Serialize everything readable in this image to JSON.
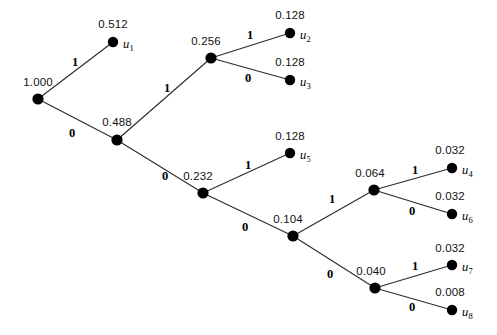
{
  "figure": {
    "background_color": "#ffffff",
    "node_color": "#000000",
    "edge_color": "#2b2b2b",
    "text_color": "#111111",
    "width": 497,
    "height": 335
  },
  "nodes": [
    {
      "id": "root",
      "label": "1.000",
      "x": 38,
      "y": 99,
      "label_x": 38,
      "label_y": 82,
      "leaf": false,
      "leaf_symbol": "",
      "sub": ""
    },
    {
      "id": "n1",
      "label": "0.512",
      "x": 113,
      "y": 42,
      "label_x": 113,
      "label_y": 24,
      "leaf": true,
      "leaf_symbol": "u",
      "sub": "1"
    },
    {
      "id": "n0",
      "label": "0.488",
      "x": 117,
      "y": 140,
      "label_x": 117,
      "label_y": 122,
      "leaf": false,
      "leaf_symbol": "",
      "sub": ""
    },
    {
      "id": "n01",
      "label": "0.256",
      "x": 211,
      "y": 58,
      "label_x": 206,
      "label_y": 41,
      "leaf": false,
      "leaf_symbol": "",
      "sub": ""
    },
    {
      "id": "n011",
      "label": "0.128",
      "x": 290,
      "y": 33,
      "label_x": 290,
      "label_y": 15,
      "leaf": true,
      "leaf_symbol": "u",
      "sub": "2"
    },
    {
      "id": "n010",
      "label": "0.128",
      "x": 290,
      "y": 80,
      "label_x": 290,
      "label_y": 62,
      "leaf": true,
      "leaf_symbol": "u",
      "sub": "3"
    },
    {
      "id": "n00",
      "label": "0.232",
      "x": 203,
      "y": 193,
      "label_x": 198,
      "label_y": 176,
      "leaf": false,
      "leaf_symbol": "",
      "sub": ""
    },
    {
      "id": "n001",
      "label": "0.128",
      "x": 290,
      "y": 153,
      "label_x": 290,
      "label_y": 136,
      "leaf": true,
      "leaf_symbol": "u",
      "sub": "5"
    },
    {
      "id": "n000",
      "label": "0.104",
      "x": 293,
      "y": 236,
      "label_x": 288,
      "label_y": 219,
      "leaf": false,
      "leaf_symbol": "",
      "sub": ""
    },
    {
      "id": "n0001",
      "label": "0.064",
      "x": 374,
      "y": 190,
      "label_x": 370,
      "label_y": 173,
      "leaf": false,
      "leaf_symbol": "",
      "sub": ""
    },
    {
      "id": "n00011",
      "label": "0.032",
      "x": 452,
      "y": 168,
      "label_x": 450,
      "label_y": 150,
      "leaf": true,
      "leaf_symbol": "u",
      "sub": "4"
    },
    {
      "id": "n00010",
      "label": "0.032",
      "x": 452,
      "y": 214,
      "label_x": 450,
      "label_y": 196,
      "leaf": true,
      "leaf_symbol": "u",
      "sub": "6"
    },
    {
      "id": "n0000",
      "label": "0.040",
      "x": 375,
      "y": 288,
      "label_x": 371,
      "label_y": 271,
      "leaf": false,
      "leaf_symbol": "",
      "sub": ""
    },
    {
      "id": "n00001",
      "label": "0.032",
      "x": 452,
      "y": 265,
      "label_x": 450,
      "label_y": 248,
      "leaf": true,
      "leaf_symbol": "u",
      "sub": "7"
    },
    {
      "id": "n00000",
      "label": "0.008",
      "x": 452,
      "y": 310,
      "label_x": 450,
      "label_y": 292,
      "leaf": true,
      "leaf_symbol": "u",
      "sub": "8"
    }
  ],
  "edges": [
    {
      "from": "root",
      "to": "n1",
      "bit": "1",
      "bit_x": 75,
      "bit_y": 62
    },
    {
      "from": "root",
      "to": "n0",
      "bit": "0",
      "bit_x": 72,
      "bit_y": 133
    },
    {
      "from": "n0",
      "to": "n01",
      "bit": "1",
      "bit_x": 167,
      "bit_y": 88
    },
    {
      "from": "n0",
      "to": "n00",
      "bit": "0",
      "bit_x": 165,
      "bit_y": 176
    },
    {
      "from": "n01",
      "to": "n011",
      "bit": "1",
      "bit_x": 250,
      "bit_y": 35
    },
    {
      "from": "n01",
      "to": "n010",
      "bit": "0",
      "bit_x": 248,
      "bit_y": 78
    },
    {
      "from": "n00",
      "to": "n001",
      "bit": "1",
      "bit_x": 248,
      "bit_y": 165
    },
    {
      "from": "n00",
      "to": "n000",
      "bit": "0",
      "bit_x": 245,
      "bit_y": 227
    },
    {
      "from": "n000",
      "to": "n0001",
      "bit": "1",
      "bit_x": 332,
      "bit_y": 199
    },
    {
      "from": "n000",
      "to": "n0000",
      "bit": "0",
      "bit_x": 330,
      "bit_y": 274
    },
    {
      "from": "n0001",
      "to": "n00011",
      "bit": "1",
      "bit_x": 415,
      "bit_y": 170
    },
    {
      "from": "n0001",
      "to": "n00010",
      "bit": "0",
      "bit_x": 412,
      "bit_y": 211
    },
    {
      "from": "n0000",
      "to": "n00001",
      "bit": "1",
      "bit_x": 415,
      "bit_y": 266
    },
    {
      "from": "n0000",
      "to": "n00000",
      "bit": "0",
      "bit_x": 412,
      "bit_y": 307
    }
  ],
  "chart_data": {
    "type": "tree",
    "root_probability": 1.0,
    "leaves": [
      {
        "symbol": "u1",
        "probability": 0.512,
        "code": "1"
      },
      {
        "symbol": "u2",
        "probability": 0.128,
        "code": "011"
      },
      {
        "symbol": "u3",
        "probability": 0.128,
        "code": "010"
      },
      {
        "symbol": "u5",
        "probability": 0.128,
        "code": "001"
      },
      {
        "symbol": "u4",
        "probability": 0.032,
        "code": "00011"
      },
      {
        "symbol": "u6",
        "probability": 0.032,
        "code": "00010"
      },
      {
        "symbol": "u7",
        "probability": 0.032,
        "code": "00001"
      },
      {
        "symbol": "u8",
        "probability": 0.008,
        "code": "00000"
      }
    ],
    "internal_nodes": [
      {
        "probability": 1.0,
        "code": ""
      },
      {
        "probability": 0.488,
        "code": "0"
      },
      {
        "probability": 0.256,
        "code": "01"
      },
      {
        "probability": 0.232,
        "code": "00"
      },
      {
        "probability": 0.104,
        "code": "000"
      },
      {
        "probability": 0.064,
        "code": "0001"
      },
      {
        "probability": 0.04,
        "code": "0000"
      }
    ]
  }
}
